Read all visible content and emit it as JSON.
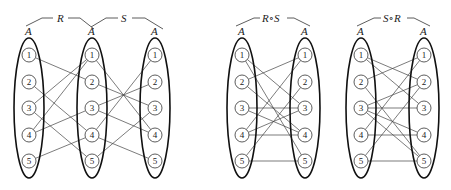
{
  "set_label": "A",
  "node_labels": [
    "1",
    "2",
    "3",
    "4",
    "5"
  ],
  "diagrams": [
    {
      "id": "R-S",
      "columns": [
        {
          "x": 29,
          "label": "A"
        },
        {
          "x": 92,
          "label": "A"
        },
        {
          "x": 155,
          "label": "A"
        }
      ],
      "relations": [
        {
          "name": "R",
          "from_col": 0,
          "to_col": 1,
          "edges": [
            [
              1,
              2
            ],
            [
              2,
              4
            ],
            [
              3,
              1
            ],
            [
              3,
              5
            ],
            [
              4,
              1
            ],
            [
              4,
              3
            ],
            [
              5,
              4
            ]
          ]
        },
        {
          "name": "S",
          "from_col": 1,
          "to_col": 2,
          "edges": [
            [
              1,
              4
            ],
            [
              2,
              3
            ],
            [
              3,
              2
            ],
            [
              3,
              4
            ],
            [
              4,
              1
            ],
            [
              4,
              5
            ],
            [
              5,
              3
            ]
          ]
        }
      ]
    },
    {
      "id": "RoS",
      "title": "R∘S",
      "columns": [
        {
          "x": 242,
          "label": "A"
        },
        {
          "x": 305,
          "label": "A"
        }
      ],
      "relations": [
        {
          "name": "R∘S",
          "from_col": 0,
          "to_col": 1,
          "edges": [
            [
              1,
              3
            ],
            [
              1,
              5
            ],
            [
              2,
              1
            ],
            [
              2,
              4
            ],
            [
              3,
              3
            ],
            [
              3,
              4
            ],
            [
              4,
              1
            ],
            [
              4,
              3
            ],
            [
              4,
              4
            ],
            [
              5,
              2
            ],
            [
              5,
              5
            ]
          ]
        }
      ]
    },
    {
      "id": "SoR",
      "title": "S∘R",
      "columns": [
        {
          "x": 361,
          "label": "A"
        },
        {
          "x": 424,
          "label": "A"
        }
      ],
      "relations": [
        {
          "name": "S∘R",
          "from_col": 0,
          "to_col": 1,
          "edges": [
            [
              1,
              2
            ],
            [
              1,
              3
            ],
            [
              2,
              1
            ],
            [
              2,
              5
            ],
            [
              3,
              2
            ],
            [
              3,
              3
            ],
            [
              3,
              4
            ],
            [
              3,
              5
            ],
            [
              4,
              1
            ],
            [
              4,
              4
            ],
            [
              5,
              2
            ],
            [
              5,
              5
            ]
          ]
        }
      ]
    }
  ],
  "labels": {
    "R": "R",
    "S": "S",
    "RoS": "R∘S",
    "SoR": "S∘R"
  }
}
